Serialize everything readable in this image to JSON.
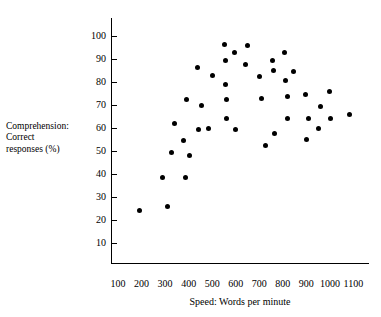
{
  "chart_data": {
    "type": "scatter",
    "title": "",
    "xlabel": "Speed: Words per minute",
    "ylabel": "Comprehension: Correct responses (%)",
    "ylabel_lines": [
      "Comprehension:",
      "Correct",
      "responses (%)"
    ],
    "xlim": [
      100,
      1150
    ],
    "ylim": [
      5,
      107
    ],
    "xticks": [
      100,
      200,
      300,
      400,
      500,
      600,
      700,
      800,
      900,
      1000,
      1100
    ],
    "yticks": [
      10,
      20,
      30,
      40,
      50,
      60,
      70,
      80,
      90,
      100
    ],
    "xtick_labels": [
      "100",
      "200",
      "300",
      "400",
      "500",
      "600",
      "700",
      "800",
      "900",
      "1000",
      "1100"
    ],
    "ytick_labels": [
      "10",
      "20",
      "30",
      "40",
      "50",
      "60",
      "70",
      "80",
      "90",
      "100"
    ],
    "grid": false,
    "legend": "none",
    "marker": "filled-circle",
    "marker_color": "#000000",
    "points": [
      {
        "x": 193,
        "y": 24
      },
      {
        "x": 291,
        "y": 38.5
      },
      {
        "x": 312,
        "y": 26
      },
      {
        "x": 326,
        "y": 49.5
      },
      {
        "x": 338,
        "y": 62
      },
      {
        "x": 377,
        "y": 54.5
      },
      {
        "x": 385,
        "y": 38.5
      },
      {
        "x": 393,
        "y": 72.5
      },
      {
        "x": 402,
        "y": 48
      },
      {
        "x": 438,
        "y": 86.5
      },
      {
        "x": 443,
        "y": 59.5
      },
      {
        "x": 453,
        "y": 70
      },
      {
        "x": 486,
        "y": 60
      },
      {
        "x": 500,
        "y": 83
      },
      {
        "x": 552,
        "y": 96.5
      },
      {
        "x": 556,
        "y": 89.5
      },
      {
        "x": 558,
        "y": 79
      },
      {
        "x": 560,
        "y": 72.5
      },
      {
        "x": 562,
        "y": 64
      },
      {
        "x": 594,
        "y": 93
      },
      {
        "x": 600,
        "y": 59.5
      },
      {
        "x": 643,
        "y": 87.5
      },
      {
        "x": 652,
        "y": 96
      },
      {
        "x": 702,
        "y": 82.5
      },
      {
        "x": 708,
        "y": 73
      },
      {
        "x": 725,
        "y": 52.5
      },
      {
        "x": 757,
        "y": 89.5
      },
      {
        "x": 761,
        "y": 85
      },
      {
        "x": 765,
        "y": 57.5
      },
      {
        "x": 806,
        "y": 93
      },
      {
        "x": 812,
        "y": 80.5
      },
      {
        "x": 818,
        "y": 64
      },
      {
        "x": 822,
        "y": 73.5
      },
      {
        "x": 845,
        "y": 84.5
      },
      {
        "x": 897,
        "y": 74.5
      },
      {
        "x": 902,
        "y": 55
      },
      {
        "x": 908,
        "y": 64
      },
      {
        "x": 952,
        "y": 60
      },
      {
        "x": 958,
        "y": 69.5
      },
      {
        "x": 1000,
        "y": 76
      },
      {
        "x": 1004,
        "y": 64
      },
      {
        "x": 1082,
        "y": 66
      }
    ]
  }
}
